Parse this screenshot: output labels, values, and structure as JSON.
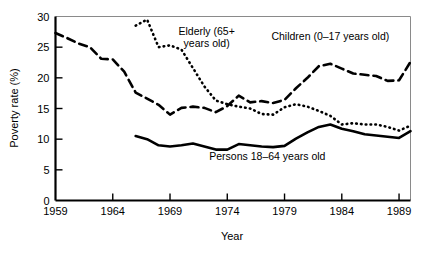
{
  "chart_data": {
    "type": "line",
    "title": "",
    "xlabel": "Year",
    "ylabel": "Poverty rate (%)",
    "xlim": [
      1959,
      1990
    ],
    "ylim": [
      0,
      30
    ],
    "grid": false,
    "legend_position": "inline-annotations",
    "xticks": [
      1959,
      1964,
      1969,
      1974,
      1979,
      1984,
      1989
    ],
    "xticklabels": [
      "1959",
      "1964",
      "1969",
      "1974",
      "1979",
      "1984",
      "1989"
    ],
    "yticks": [
      0,
      5,
      10,
      15,
      20,
      25,
      30
    ],
    "yticklabels": [
      "0",
      "5",
      "10",
      "15",
      "20",
      "25",
      "30"
    ],
    "annotations": [
      {
        "text_line1": "Elderly (65+",
        "text_line2": "years old)",
        "x": 1972.2,
        "y": 27.0
      },
      {
        "text_line1": "Children (0–17 years old)",
        "text_line2": "",
        "x": 1983.0,
        "y": 26.2
      },
      {
        "text_line1": "Persons 18–64 years old",
        "text_line2": "",
        "x": 1977.5,
        "y": 6.6
      }
    ],
    "series": [
      {
        "name": "Children (0–17 years old)",
        "style": "dashed",
        "x": [
          1959,
          1960,
          1961,
          1962,
          1963,
          1964,
          1965,
          1966,
          1967,
          1968,
          1969,
          1970,
          1971,
          1972,
          1973,
          1974,
          1975,
          1976,
          1977,
          1978,
          1979,
          1980,
          1981,
          1982,
          1983,
          1984,
          1985,
          1986,
          1987,
          1988,
          1989,
          1990
        ],
        "values": [
          27.3,
          26.5,
          25.6,
          25.0,
          23.1,
          23.0,
          21.0,
          17.6,
          16.6,
          15.6,
          14.0,
          15.1,
          15.3,
          15.1,
          14.4,
          15.4,
          17.1,
          16.0,
          16.2,
          15.9,
          16.4,
          18.3,
          20.0,
          21.9,
          22.3,
          21.5,
          20.7,
          20.5,
          20.3,
          19.5,
          19.6,
          20.6
        ],
        "final_value": 22.6
      },
      {
        "name": "Elderly (65+ years old)",
        "style": "dotted",
        "x": [
          1966,
          1967,
          1968,
          1969,
          1970,
          1971,
          1972,
          1973,
          1974,
          1975,
          1976,
          1977,
          1978,
          1979,
          1980,
          1981,
          1982,
          1983,
          1984,
          1985,
          1986,
          1987,
          1988,
          1989,
          1990
        ],
        "values": [
          28.5,
          29.5,
          25.0,
          25.3,
          24.6,
          21.6,
          18.6,
          16.3,
          15.7,
          15.3,
          15.0,
          14.1,
          14.0,
          15.2,
          15.7,
          15.3,
          14.6,
          13.8,
          12.4,
          12.6,
          12.4,
          12.4,
          12.0,
          11.4,
          12.2
        ],
        "final_value": 12.2
      },
      {
        "name": "Persons 18–64 years old",
        "style": "solid",
        "x": [
          1966,
          1967,
          1968,
          1969,
          1970,
          1971,
          1972,
          1973,
          1974,
          1975,
          1976,
          1977,
          1978,
          1979,
          1980,
          1981,
          1982,
          1983,
          1984,
          1985,
          1986,
          1987,
          1988,
          1989,
          1990
        ],
        "values": [
          10.5,
          10.0,
          9.0,
          8.8,
          9.0,
          9.3,
          8.8,
          8.3,
          8.3,
          9.2,
          9.0,
          8.8,
          8.7,
          8.9,
          10.1,
          11.1,
          12.0,
          12.4,
          11.7,
          11.3,
          10.8,
          10.6,
          10.4,
          10.2,
          10.7
        ],
        "final_value": 11.3
      }
    ]
  }
}
